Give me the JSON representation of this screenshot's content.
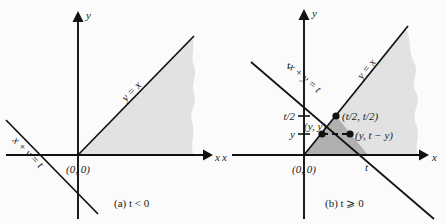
{
  "figure": {
    "width": 445,
    "height": 224,
    "background": "#fbfbfb",
    "colors": {
      "light_region": "#e2e2e2",
      "dark_region": "#b0b0b0",
      "ink": "#111111"
    }
  },
  "panel_a": {
    "caption": "(a) t < 0",
    "axis_x_label": "x",
    "axis_y_label": "y",
    "origin_label": "(0, 0)",
    "line_diagonal_label": "y = x",
    "line_antidiagonal_label": "x + y = t",
    "region_shaded": "region below y = x, right of origin, extends to the right edge",
    "region_color": "#e2e2e2"
  },
  "panel_b": {
    "caption": "(b) t ⩾ 0",
    "axis_x_label": "x",
    "axis_y_label": "y",
    "axis_x_label_left": "x",
    "origin_label": "(0, 0)",
    "line_diagonal_label": "y = x",
    "line_antidiagonal_label": "x + y = t",
    "ytick_t": "t",
    "ytick_thalf": "t/2",
    "ytick_y": "y",
    "xtick_t": "t",
    "point_intersection": "(t/2, t/2)",
    "point_left": "(y, y)",
    "point_right": "(y, t − y)",
    "light_region_color": "#e2e2e2",
    "dark_region_color": "#b0b0b0"
  }
}
